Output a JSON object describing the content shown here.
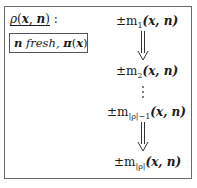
{
  "rule": {
    "name": "ρ",
    "args_open": "(",
    "arg1": "x",
    "sep": ", ",
    "arg2": "n",
    "args_close": ")",
    "colon": " :"
  },
  "condition": {
    "var": "n",
    "fresh": " fresh, ",
    "pi": "π",
    "open": "(",
    "arg": "x",
    "close": ")"
  },
  "messages": [
    {
      "prefix": "±m",
      "subscript": "1",
      "args": "(x, n)"
    },
    {
      "prefix": "±m",
      "subscript": "2",
      "args": "(x, n)"
    },
    {
      "prefix": "±m",
      "subscript": "|ρ|−1",
      "args": "(x, n)"
    },
    {
      "prefix": "±m",
      "subscript": "|ρ|",
      "args": "(x, n)"
    }
  ],
  "ellipsis": "⋮",
  "colors": {
    "border": "#6a6a6a",
    "text": "#1a1a1a"
  }
}
